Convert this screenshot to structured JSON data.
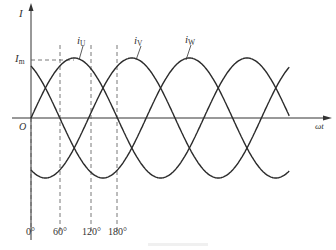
{
  "chart_data": {
    "type": "line",
    "title": "",
    "xlabel": "ωt",
    "ylabel": "I",
    "origin_label": "O",
    "peak_label": "Im",
    "grid": false,
    "legend_position": "inline-curve-labels",
    "x_ticks": [
      "0°",
      "60°",
      "120°",
      "180°"
    ],
    "x_tick_degrees": [
      0,
      60,
      120,
      180
    ],
    "x_range_degrees": [
      0,
      540
    ],
    "ylim": [
      -1,
      1
    ],
    "series": [
      {
        "name": "iU",
        "label_main": "i",
        "label_sub": "U",
        "phase_deg": 0,
        "amplitude": 1
      },
      {
        "name": "iV",
        "label_main": "i",
        "label_sub": "V",
        "phase_deg": -120,
        "amplitude": 1
      },
      {
        "name": "iW",
        "label_main": "i",
        "label_sub": "W",
        "phase_deg": -240,
        "amplitude": 1
      }
    ],
    "annotations": [
      {
        "type": "dashed-hline",
        "at": "Im",
        "from_deg": 0,
        "to_deg": 90
      },
      {
        "type": "dashed-vline",
        "at_deg": 0
      },
      {
        "type": "dashed-vline",
        "at_deg": 60
      },
      {
        "type": "dashed-vline",
        "at_deg": 120
      },
      {
        "type": "dashed-vline",
        "at_deg": 180
      }
    ]
  },
  "labels": {
    "y_axis": "I",
    "x_axis": "ωt",
    "origin": "O",
    "peak_main": "I",
    "peak_sub": "m",
    "iu_main": "i",
    "iu_sub": "U",
    "iv_main": "i",
    "iv_sub": "V",
    "iw_main": "i",
    "iw_sub": "W",
    "tick_0": "0°",
    "tick_60": "60°",
    "tick_120": "120°",
    "tick_180": "180°"
  },
  "colors": {
    "curve": "#2b2b2b",
    "axis": "#333333",
    "dash": "#555555",
    "background": "#ffffff"
  }
}
